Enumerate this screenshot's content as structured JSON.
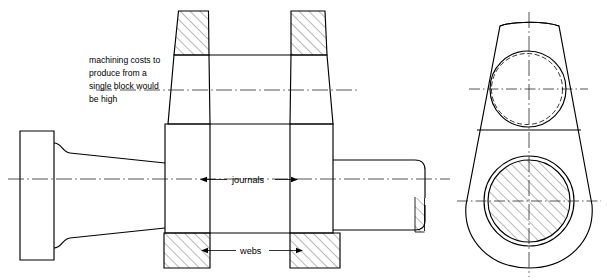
{
  "drawing": {
    "type": "engineering-sectional-drawing",
    "subject": "crankshaft",
    "background_color": "#ffffff",
    "line_color": "#000000",
    "canvas": {
      "width": 607,
      "height": 280
    },
    "annotations": {
      "note": {
        "name": "machining-note",
        "lines": [
          "machining costs to",
          "produce from a",
          "single block would",
          "be high"
        ],
        "full_text": "machining costs to produce from a single block would be high"
      },
      "journals_label": "journals",
      "webs_label": "webs"
    },
    "views": {
      "side_section": {
        "name": "side-sectional-view",
        "features": [
          "left-flange",
          "tapered-main-shaft",
          "left-journal",
          "left-web",
          "crank-pin",
          "right-web",
          "right-journal",
          "right-shaft-with-break"
        ]
      },
      "end_view": {
        "name": "end-view",
        "features": [
          "teardrop-web-outline",
          "crank-pin-bore-circle",
          "hidden-circle",
          "main-journal-circle-sectioned",
          "horizontal-parting-line"
        ]
      }
    },
    "line_types": {
      "visible_edge": "solid",
      "hidden_edge": "dashed",
      "axis": "chain-dash-dot",
      "section": "45-degree-hatch"
    }
  }
}
